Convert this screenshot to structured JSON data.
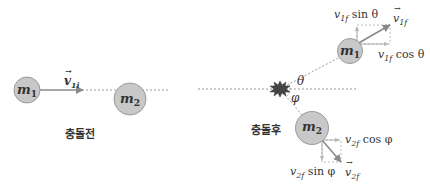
{
  "diagram": {
    "before": {
      "caption": "충돌전",
      "mass1": {
        "symbol": "m",
        "subscript": "1"
      },
      "mass2": {
        "symbol": "m",
        "subscript": "2"
      },
      "velocity_label": {
        "symbol": "v",
        "subscript": "1i"
      }
    },
    "after": {
      "caption": "충돌후",
      "mass1": {
        "symbol": "m",
        "subscript": "1"
      },
      "mass2": {
        "symbol": "m",
        "subscript": "2"
      },
      "angle1": "θ",
      "angle2": "φ",
      "v1f_vector": {
        "symbol": "v",
        "subscript": "1f"
      },
      "v1f_sin": {
        "symbol": "v",
        "subscript": "1f",
        "func": "sin θ"
      },
      "v1f_cos": {
        "symbol": "v",
        "subscript": "1f",
        "func": "cos θ"
      },
      "v2f_vector": {
        "symbol": "v",
        "subscript": "2f"
      },
      "v2f_sin": {
        "symbol": "v",
        "subscript": "2f",
        "func": "sin φ"
      },
      "v2f_cos": {
        "symbol": "v",
        "subscript": "2f",
        "func": "cos φ"
      }
    },
    "colors": {
      "ball_fill": "#c8c8c8",
      "ball_stroke": "#9a9a9a",
      "arrow": "#8a8a8a",
      "dashed": "#9a9a9a",
      "text": "#333333",
      "explosion": "#444444"
    }
  }
}
